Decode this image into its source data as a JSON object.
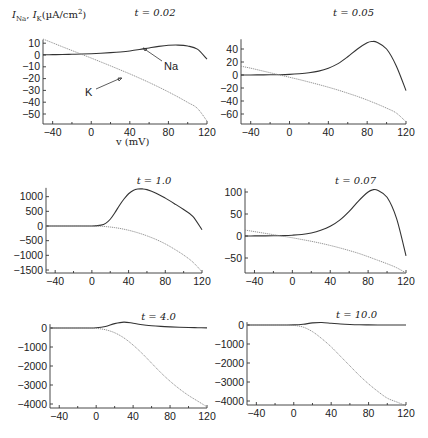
{
  "figure": {
    "ylabel": "I_Na, I_K(µA/cm²)",
    "ylabel_parts": {
      "i1": "I",
      "s1": "Na",
      "sep": ", ",
      "i2": "I",
      "s2": "K",
      "unit": "(µA/cm",
      "sup": "2",
      "close": ")"
    },
    "xlabel": "v (mV)",
    "annotations": {
      "na": "Na",
      "k": "K"
    }
  },
  "chart_data": [
    {
      "type": "line",
      "title": "t = 0.02",
      "xlabel": "v (mV)",
      "ylabel": "I_Na, I_K (µA/cm²)",
      "xlim": [
        -50,
        120
      ],
      "ylim": [
        -58,
        13
      ],
      "xticks": [
        -40,
        0,
        40,
        80,
        120
      ],
      "yticks": [
        10,
        0,
        -10,
        -20,
        -30,
        -40,
        -50
      ],
      "grid": false,
      "px": {
        "x0": 43,
        "x1": 207,
        "xv0": -50,
        "xv1": 120,
        "ybase": 124,
        "ya": 55,
        "yva": 0,
        "yb": 114,
        "yvb": -50
      },
      "x": [
        -50,
        -40,
        -30,
        -20,
        -10,
        0,
        10,
        20,
        30,
        40,
        50,
        60,
        70,
        80,
        90,
        100,
        110,
        120
      ],
      "series": [
        {
          "name": "Na",
          "style": "solid",
          "values": [
            0.2,
            0.3,
            0.4,
            0.6,
            0.8,
            1.1,
            1.5,
            2.0,
            2.6,
            3.4,
            4.6,
            6.0,
            7.3,
            8.2,
            8.4,
            7.6,
            5.0,
            -3.5
          ]
        },
        {
          "name": "K",
          "style": "dotted",
          "values": [
            13.5,
            10.3,
            7.0,
            3.8,
            0.6,
            -2.6,
            -5.9,
            -9.2,
            -12.6,
            -16.0,
            -19.6,
            -23.3,
            -27.2,
            -31.3,
            -35.6,
            -40.2,
            -45.2,
            -56.0
          ]
        }
      ]
    },
    {
      "type": "line",
      "title": "t = 0.05",
      "xlabel": "",
      "ylabel": "",
      "xlim": [
        -50,
        120
      ],
      "ylim": [
        -75,
        55
      ],
      "xticks": [
        -40,
        0,
        40,
        80,
        120
      ],
      "yticks": [
        40,
        20,
        0,
        -20,
        -40,
        -60
      ],
      "grid": false,
      "px": {
        "x0": 241,
        "x1": 406,
        "xv0": -50,
        "xv1": 120,
        "ybase": 124,
        "ya": 75,
        "yva": 0,
        "yb": 114,
        "yvb": -60
      },
      "x": [
        -50,
        -40,
        -30,
        -20,
        -10,
        0,
        10,
        20,
        30,
        40,
        50,
        60,
        70,
        80,
        85,
        90,
        100,
        110,
        120
      ],
      "series": [
        {
          "name": "Na",
          "style": "solid",
          "values": [
            0.1,
            0.1,
            0.2,
            0.3,
            0.5,
            1.0,
            2.0,
            3.5,
            6.0,
            10.5,
            17.5,
            28.0,
            40.0,
            49.5,
            51.5,
            50.5,
            40.0,
            14.0,
            -24.0
          ]
        },
        {
          "name": "K",
          "style": "dotted",
          "values": [
            13.5,
            10.5,
            7.0,
            3.5,
            0.0,
            -3.5,
            -7.0,
            -10.8,
            -14.7,
            -18.8,
            -23.2,
            -28.0,
            -33.0,
            -38.5,
            -41.5,
            -44.5,
            -51.0,
            -58.5,
            -72.0
          ]
        }
      ]
    },
    {
      "type": "line",
      "title": "t = 1.0",
      "xlabel": "",
      "ylabel": "",
      "xlim": [
        -50,
        120
      ],
      "ylim": [
        -1600,
        1300
      ],
      "xticks": [
        -40,
        0,
        40,
        80,
        120
      ],
      "yticks": [
        1000,
        500,
        0,
        -500,
        -1000,
        -1500
      ],
      "grid": false,
      "px": {
        "x0": 46,
        "x1": 202,
        "xv0": -50,
        "xv1": 120,
        "ybase": 273,
        "ya": 226,
        "yva": 0,
        "yb": 270,
        "yvb": -1500
      },
      "x": [
        -50,
        -40,
        -30,
        -20,
        -10,
        0,
        10,
        15,
        20,
        25,
        30,
        35,
        40,
        45,
        50,
        55,
        60,
        70,
        80,
        90,
        100,
        110,
        120
      ],
      "series": [
        {
          "name": "Na",
          "style": "solid",
          "values": [
            0,
            0,
            0,
            0,
            0,
            2,
            30,
            90,
            230,
            450,
            700,
            920,
            1100,
            1210,
            1260,
            1265,
            1240,
            1120,
            950,
            760,
            560,
            330,
            -130
          ]
        },
        {
          "name": "K",
          "style": "dotted",
          "values": [
            0,
            0,
            0,
            0,
            0,
            -2,
            -10,
            -20,
            -35,
            -55,
            -80,
            -110,
            -145,
            -185,
            -230,
            -280,
            -335,
            -460,
            -610,
            -790,
            -990,
            -1230,
            -1560
          ]
        }
      ]
    },
    {
      "type": "line",
      "title": "t = 0.07",
      "xlabel": "",
      "ylabel": "",
      "xlim": [
        -50,
        120
      ],
      "ylim": [
        -85,
        108
      ],
      "xticks": [
        -40,
        0,
        40,
        80,
        120
      ],
      "yticks": [
        100,
        50,
        0,
        -50
      ],
      "grid": false,
      "px": {
        "x0": 245,
        "x1": 406,
        "xv0": -50,
        "xv1": 120,
        "ybase": 273,
        "ya": 236,
        "yva": 0,
        "yb": 192,
        "yvb": 100
      },
      "x": [
        -50,
        -40,
        -30,
        -20,
        -10,
        0,
        10,
        20,
        30,
        40,
        50,
        60,
        70,
        80,
        85,
        90,
        100,
        110,
        120
      ],
      "series": [
        {
          "name": "Na",
          "style": "solid",
          "values": [
            0.1,
            0.2,
            0.3,
            0.5,
            0.9,
            1.8,
            3.5,
            7.0,
            13.0,
            22.0,
            36.0,
            56.0,
            80.0,
            100.0,
            105.0,
            104.0,
            88.0,
            40.0,
            -45.0
          ]
        },
        {
          "name": "K",
          "style": "dotted",
          "values": [
            13.5,
            10.0,
            6.5,
            3.0,
            -0.5,
            -4.0,
            -8.0,
            -12.0,
            -16.5,
            -21.5,
            -27.0,
            -33.0,
            -39.5,
            -47.0,
            -51.0,
            -55.0,
            -63.0,
            -72.0,
            -84.0
          ]
        }
      ]
    },
    {
      "type": "line",
      "title": "t = 4.0",
      "xlabel": "",
      "ylabel": "",
      "xlim": [
        -50,
        120
      ],
      "ylim": [
        -4200,
        200
      ],
      "xticks": [
        -40,
        0,
        40,
        80,
        120
      ],
      "yticks": [
        0,
        -1000,
        -2000,
        -3000,
        -4000
      ],
      "grid": false,
      "px": {
        "x0": 50,
        "x1": 207,
        "xv0": -50,
        "xv1": 120,
        "ybase": 408,
        "ya": 328,
        "yva": 0,
        "yb": 404,
        "yvb": -4000
      },
      "x": [
        -50,
        -40,
        -30,
        -20,
        -10,
        0,
        10,
        20,
        30,
        40,
        50,
        60,
        70,
        80,
        90,
        100,
        110,
        120
      ],
      "series": [
        {
          "name": "Na",
          "style": "solid",
          "values": [
            0,
            0,
            0,
            0,
            0,
            10,
            80,
            230,
            310,
            250,
            170,
            120,
            85,
            60,
            40,
            25,
            15,
            5
          ]
        },
        {
          "name": "K",
          "style": "dotted",
          "values": [
            0,
            0,
            0,
            0,
            0,
            -20,
            -90,
            -250,
            -520,
            -900,
            -1350,
            -1850,
            -2350,
            -2800,
            -3200,
            -3550,
            -3850,
            -4150
          ]
        }
      ]
    },
    {
      "type": "line",
      "title": "t = 10.0",
      "xlabel": "",
      "ylabel": "",
      "xlim": [
        -50,
        120
      ],
      "ylim": [
        -4300,
        150
      ],
      "xticks": [
        -40,
        0,
        40,
        80,
        120
      ],
      "yticks": [
        0,
        -1000,
        -2000,
        -3000,
        -4000
      ],
      "grid": false,
      "px": {
        "x0": 247,
        "x1": 406,
        "xv0": -50,
        "xv1": 120,
        "ybase": 405,
        "ya": 325,
        "yva": 0,
        "yb": 401,
        "yvb": -4000
      },
      "x": [
        -50,
        -40,
        -30,
        -20,
        -10,
        0,
        10,
        20,
        30,
        40,
        50,
        60,
        70,
        80,
        90,
        100,
        110,
        120
      ],
      "series": [
        {
          "name": "Na",
          "style": "solid",
          "values": [
            0,
            0,
            0,
            0,
            0,
            5,
            40,
            110,
            130,
            90,
            50,
            25,
            10,
            5,
            2,
            0,
            0,
            0
          ]
        },
        {
          "name": "K",
          "style": "dotted",
          "values": [
            0,
            0,
            0,
            0,
            0,
            -20,
            -110,
            -350,
            -720,
            -1150,
            -1650,
            -2150,
            -2650,
            -3100,
            -3500,
            -3850,
            -4050,
            -4250
          ]
        }
      ]
    }
  ]
}
